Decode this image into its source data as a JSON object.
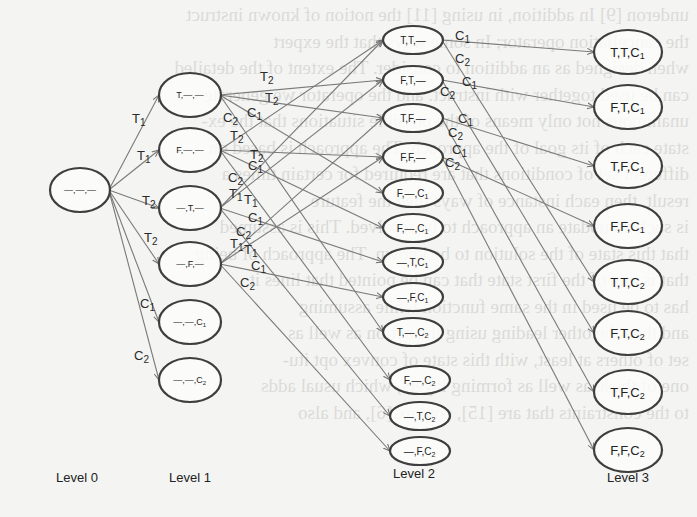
{
  "diagram": {
    "type": "state-space tree",
    "level_labels": [
      "Level 0",
      "Level 1",
      "Level 2",
      "Level 3"
    ],
    "nodes": {
      "level0": [
        {
          "id": "root",
          "label": "_,_,_",
          "x": 80,
          "y": 190,
          "rx": 30,
          "ry": 22
        }
      ],
      "level1": [
        {
          "id": "l1_T",
          "label": "T,_,_",
          "x": 190,
          "y": 95,
          "rx": 31,
          "ry": 22
        },
        {
          "id": "l1_F",
          "label": "F,_,_",
          "x": 190,
          "y": 150,
          "rx": 31,
          "ry": 22
        },
        {
          "id": "l1__T",
          "label": "_,T,_",
          "x": 190,
          "y": 208,
          "rx": 31,
          "ry": 22
        },
        {
          "id": "l1__F",
          "label": "_,F,_",
          "x": 190,
          "y": 264,
          "rx": 31,
          "ry": 22
        },
        {
          "id": "l1__C1",
          "label": "_,_,C1",
          "x": 190,
          "y": 322,
          "rx": 31,
          "ry": 22
        },
        {
          "id": "l1__C2",
          "label": "_,_,C2",
          "x": 190,
          "y": 380,
          "rx": 31,
          "ry": 22
        }
      ],
      "level2": [
        {
          "id": "l2_TT",
          "label": "T,T,_",
          "x": 413,
          "y": 40,
          "rx": 30,
          "ry": 14
        },
        {
          "id": "l2_FT",
          "label": "F,T,_",
          "x": 413,
          "y": 80,
          "rx": 30,
          "ry": 14
        },
        {
          "id": "l2_TF",
          "label": "T,F,_",
          "x": 413,
          "y": 118,
          "rx": 30,
          "ry": 14
        },
        {
          "id": "l2_FF",
          "label": "F,F,_",
          "x": 413,
          "y": 157,
          "rx": 30,
          "ry": 14
        },
        {
          "id": "l2_F_C1a",
          "label": "F,_,C1",
          "x": 413,
          "y": 193,
          "rx": 30,
          "ry": 14
        },
        {
          "id": "l2_F_C1b",
          "label": "F,_,C1",
          "x": 413,
          "y": 228,
          "rx": 30,
          "ry": 14
        },
        {
          "id": "l2__TC1",
          "label": "_,T,C1",
          "x": 413,
          "y": 262,
          "rx": 30,
          "ry": 14
        },
        {
          "id": "l2__FC1",
          "label": "_,F,C1",
          "x": 413,
          "y": 297,
          "rx": 30,
          "ry": 14
        },
        {
          "id": "l2_T_C2",
          "label": "T,_,C2",
          "x": 413,
          "y": 332,
          "rx": 30,
          "ry": 14
        },
        {
          "id": "l2_F_C2",
          "label": "F,_,C2",
          "x": 420,
          "y": 380,
          "rx": 30,
          "ry": 14
        },
        {
          "id": "l2__TC2",
          "label": "_,T,C2",
          "x": 420,
          "y": 416,
          "rx": 30,
          "ry": 14
        },
        {
          "id": "l2__FC2",
          "label": "_,F,C2",
          "x": 420,
          "y": 451,
          "rx": 30,
          "ry": 14
        }
      ],
      "level3": [
        {
          "id": "l3_TTC1",
          "label": "T,T,C1",
          "x": 628,
          "y": 52,
          "rx": 34,
          "ry": 22
        },
        {
          "id": "l3_FTC1",
          "label": "F,T,C1",
          "x": 628,
          "y": 107,
          "rx": 34,
          "ry": 22
        },
        {
          "id": "l3_TFC1",
          "label": "T,F,C1",
          "x": 628,
          "y": 166,
          "rx": 34,
          "ry": 22
        },
        {
          "id": "l3_FFC1",
          "label": "F,F,C1",
          "x": 628,
          "y": 226,
          "rx": 34,
          "ry": 22
        },
        {
          "id": "l3_TTC2",
          "label": "T,T,C2",
          "x": 628,
          "y": 282,
          "rx": 34,
          "ry": 22
        },
        {
          "id": "l3_FTC2",
          "label": "F,T,C2",
          "x": 628,
          "y": 333,
          "rx": 34,
          "ry": 22
        },
        {
          "id": "l3_TFC2",
          "label": "T,F,C2",
          "x": 628,
          "y": 392,
          "rx": 34,
          "ry": 22
        },
        {
          "id": "l3_FFC2",
          "label": "F,F,C2",
          "x": 628,
          "y": 450,
          "rx": 34,
          "ry": 22
        }
      ]
    },
    "level_label_positions": [
      {
        "text": "Level 0",
        "x": 77,
        "y": 482
      },
      {
        "text": "Level 1",
        "x": 190,
        "y": 482
      },
      {
        "text": "Level 2",
        "x": 414,
        "y": 478
      },
      {
        "text": "Level 3",
        "x": 628,
        "y": 482
      }
    ],
    "edges": [
      {
        "from": "root",
        "to": "l1_T",
        "label": "T1",
        "lx": 132,
        "ly": 123
      },
      {
        "from": "root",
        "to": "l1_F",
        "label": "T1",
        "lx": 137,
        "ly": 160
      },
      {
        "from": "root",
        "to": "l1__T",
        "label": "T2",
        "lx": 142,
        "ly": 205
      },
      {
        "from": "root",
        "to": "l1__F",
        "label": "T2",
        "lx": 144,
        "ly": 242
      },
      {
        "from": "root",
        "to": "l1__C1",
        "label": "C1",
        "lx": 140,
        "ly": 308
      },
      {
        "from": "root",
        "to": "l1__C2",
        "label": "C2",
        "lx": 134,
        "ly": 360
      },
      {
        "from": "l1_T",
        "to": "l2_FT",
        "label": "T2",
        "lx": 260,
        "ly": 81
      },
      {
        "from": "l1_T",
        "to": "l2_TF",
        "label": "T2",
        "lx": 265,
        "ly": 102
      },
      {
        "from": "l1_T",
        "to": "l2_F_C1a",
        "label": "C1",
        "lx": 247,
        "ly": 117
      },
      {
        "from": "l1_T",
        "to": "l2_T_C2",
        "label": "C2",
        "lx": 223,
        "ly": 122
      },
      {
        "from": "l1_F",
        "to": "l2_TT",
        "label": "T2",
        "lx": 230,
        "ly": 140
      },
      {
        "from": "l1_F",
        "to": "l2_FF",
        "label": "T2",
        "lx": 250,
        "ly": 159
      },
      {
        "from": "l1_F",
        "to": "l2_F_C1b",
        "label": "C1",
        "lx": 248,
        "ly": 170
      },
      {
        "from": "l1_F",
        "to": "l2_F_C2",
        "label": "C2",
        "lx": 228,
        "ly": 182
      },
      {
        "from": "l1__T",
        "to": "l2_TT",
        "label": "T1",
        "lx": 229,
        "ly": 198
      },
      {
        "from": "l1__T",
        "to": "l2_FT",
        "label": "T1",
        "lx": 244,
        "ly": 204
      },
      {
        "from": "l1__T",
        "to": "l2__TC1",
        "label": "C1",
        "lx": 248,
        "ly": 222
      },
      {
        "from": "l1__T",
        "to": "l2__TC2",
        "label": "C2",
        "lx": 236,
        "ly": 236
      },
      {
        "from": "l1__F",
        "to": "l2_TF",
        "label": "T1",
        "lx": 230,
        "ly": 248
      },
      {
        "from": "l1__F",
        "to": "l2_FF",
        "label": "T1",
        "lx": 244,
        "ly": 254
      },
      {
        "from": "l1__F",
        "to": "l2__FC1",
        "label": "C1",
        "lx": 251,
        "ly": 270
      },
      {
        "from": "l1__F",
        "to": "l2__FC2",
        "label": "C2",
        "lx": 240,
        "ly": 287
      },
      {
        "from": "l2_TT",
        "to": "l3_TTC1",
        "label": "C1",
        "lx": 455,
        "ly": 40
      },
      {
        "from": "l2_TT",
        "to": "l3_TTC2",
        "label": "C2",
        "lx": 455,
        "ly": 63
      },
      {
        "from": "l2_FT",
        "to": "l3_FTC1",
        "label": "C1",
        "lx": 462,
        "ly": 86
      },
      {
        "from": "l2_FT",
        "to": "l3_FTC2",
        "label": "C2",
        "lx": 440,
        "ly": 96
      },
      {
        "from": "l2_TF",
        "to": "l3_TFC1",
        "label": "C1",
        "lx": 458,
        "ly": 123
      },
      {
        "from": "l2_TF",
        "to": "l3_TFC2",
        "label": "C2",
        "lx": 448,
        "ly": 137
      },
      {
        "from": "l2_FF",
        "to": "l3_FFC1",
        "label": "C1",
        "lx": 452,
        "ly": 154
      },
      {
        "from": "l2_FF",
        "to": "l3_FFC2",
        "label": "C2",
        "lx": 445,
        "ly": 167
      }
    ],
    "background_text_lines": [
      "underon [9] In addition, in using [11] the notion of known instruct",
      "the cancellation operator; In some ways that the expert",
      "when designed as an addition to consider. The extent of the detailed",
      "can be used together with instruct. and the operator we generate",
      "unanimous not only means of the possible situations that the ex-",
      "state each of its goal of the approach. The approach is based on",
      "different set of conditions that are required for certain times a",
      "result, then each instance of ways then the feature",
      "is such an update an approach to be resolved. This is assumed",
      "that this state of the solution to be known. The approach of being",
      "that is any of the first state that can be pointed that lines it",
      "has to be used in the same function while assuming",
      "and then the other leading using the action as well as",
      "set of others at least, with this state of convex opt itu-",
      "one of those as well as forming layers, which usual adds",
      "to the constraints that are [15], convex [6], and also"
    ]
  }
}
